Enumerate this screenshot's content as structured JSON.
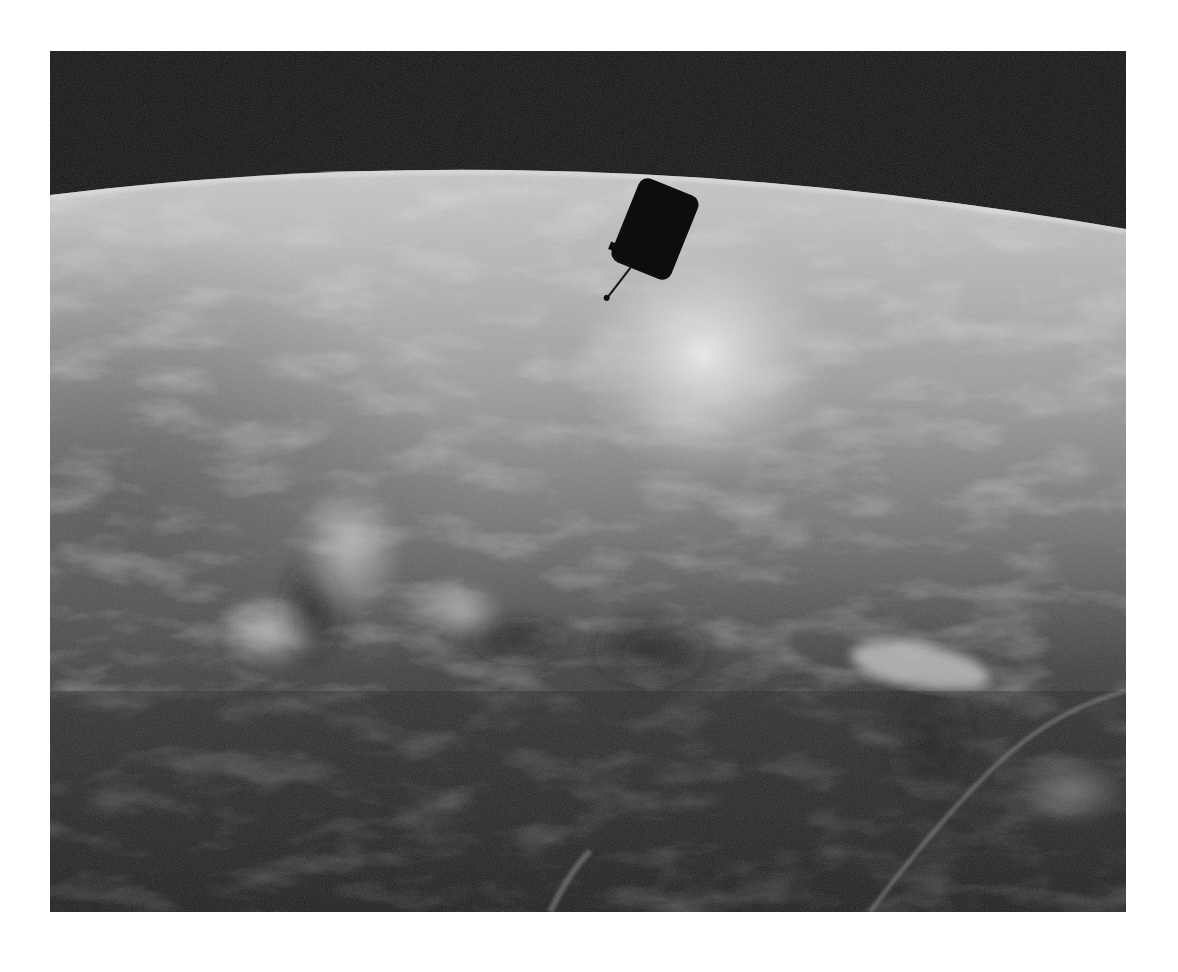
{
  "image": {
    "subject": "Satellite in orbit above Earth",
    "style": "grayscale photograph",
    "colors": {
      "page_background": "#ffffff",
      "space": "#141414",
      "horizon_haze": "#d4d4d4",
      "sunglint": "#e6e6e6",
      "cloud_mid": "#9a9a9a",
      "ocean_dark": "#2a2a2a",
      "satellite": "#0d0d0d"
    },
    "elements": [
      {
        "name": "space",
        "description": "black sky above curved horizon"
      },
      {
        "name": "earth-limb",
        "description": "bright curved horizon, higher in center"
      },
      {
        "name": "satellite",
        "description": "dark cylindrical satellite with antenna, upper center"
      },
      {
        "name": "sunglint",
        "description": "bright reflection band below satellite"
      },
      {
        "name": "cloud-cover",
        "description": "scattered clouds across mid frame"
      },
      {
        "name": "anvil-cloud",
        "description": "bright cloud with shadow, right side"
      },
      {
        "name": "dark-ocean",
        "description": "dark lower foreground with cloud streaks"
      }
    ]
  }
}
